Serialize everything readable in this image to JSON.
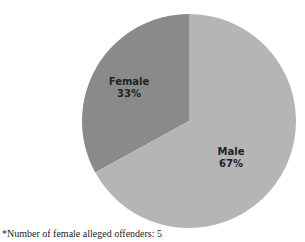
{
  "chart_data": {
    "type": "pie",
    "title": "",
    "categories": [
      "Female",
      "Male"
    ],
    "values": [
      33,
      67
    ],
    "units": "%",
    "colors": [
      "#8a8a8a",
      "#b5b5b5"
    ],
    "start_angle_deg": 0,
    "direction": "counterclockwise-first-slice",
    "data_labels": [
      {
        "name": "Female",
        "pct": "33%"
      },
      {
        "name": "Male",
        "pct": "67%"
      }
    ],
    "legend": "none",
    "footnote": "*Number of female alleged offenders: 5"
  },
  "labels": {
    "female_name": "Female",
    "female_pct": "33%",
    "male_name": "Male",
    "male_pct": "67%"
  },
  "footnote": "*Number of female alleged offenders: 5"
}
